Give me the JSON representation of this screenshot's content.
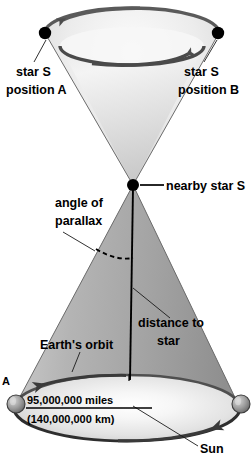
{
  "diagram": {
    "background_color": "#ffffff",
    "labels": {
      "star_s_position_a_line1": "star S",
      "star_s_position_a_line2": "position A",
      "star_s_position_b_line1": "star S",
      "star_s_position_b_line2": "position B",
      "nearby_star": "nearby star S",
      "angle_line1": "angle of",
      "angle_line2": "parallax",
      "distance_line1": "distance to",
      "distance_line2": "star",
      "earths_orbit": "Earth's orbit",
      "baseline_miles": "95,000,000 miles",
      "baseline_km": "(140,000,000 km)",
      "sun": "Sun",
      "point_a_marker": "A"
    },
    "colors": {
      "upper_cone_light": "#f4f4f4",
      "upper_cone_mid": "#d6d6d6",
      "upper_cone_dark": "#b9b9b9",
      "lower_cone_light": "#cfcfcf",
      "lower_cone_mid": "#a9a9a9",
      "lower_cone_dark": "#8e8e8e",
      "orbit_plane_light": "#f2f2f2",
      "orbit_rim": "#4a4a4a",
      "star_dot": "#000000",
      "text": "#000000",
      "edge": "#6d6d6d"
    },
    "geometry": {
      "star_vertex_x": 133,
      "star_vertex_y": 185,
      "upper_ellipse_cx": 132,
      "upper_ellipse_cy": 33,
      "upper_ellipse_rx": 87,
      "upper_ellipse_ry": 25,
      "lower_ellipse_cx": 127,
      "lower_ellipse_cy": 408,
      "lower_ellipse_rx": 113,
      "lower_ellipse_ry": 33,
      "star_a_dot_x": 45,
      "star_a_dot_y": 33,
      "star_b_dot_x": 218,
      "star_b_dot_y": 33,
      "earth_a_x": 16,
      "earth_a_y": 404,
      "earth_b_x": 240,
      "earth_b_y": 404
    },
    "annotations": {
      "upper_arrow_direction": "counter-clockwise apparent motion of star S",
      "lower_arrow_direction": "counter-clockwise orbital motion of Earth",
      "dashed_arc_meaning": "parallax angle at star vertex"
    }
  }
}
